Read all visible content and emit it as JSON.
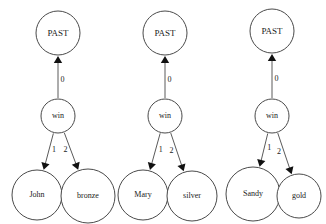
{
  "diagram": {
    "type": "dependency-tree",
    "background_color": "#ffffff",
    "node_stroke_color": "#4a4a4a",
    "edge_color": "#5a5a5a",
    "arrow_color": "#111111",
    "text_color": "#1a1a1a",
    "groups": [
      {
        "id": "group-1",
        "root": {
          "id": "past-1",
          "label": "PAST",
          "cx": 58,
          "cy": 33,
          "r": 22,
          "font_size": 9
        },
        "predicate": {
          "id": "win-1",
          "label": "win",
          "cx": 58,
          "cy": 116,
          "r": 17,
          "font_size": 8
        },
        "arguments": [
          {
            "id": "john",
            "label": "John",
            "cx": 37,
            "cy": 195,
            "r": 25,
            "font_size": 8,
            "edge_label": "1"
          },
          {
            "id": "bronze",
            "label": "bronze",
            "cx": 88,
            "cy": 196,
            "r": 27,
            "font_size": 8,
            "edge_label": "2"
          }
        ],
        "root_edge_label": "0"
      },
      {
        "id": "group-2",
        "root": {
          "id": "past-2",
          "label": "PAST",
          "cx": 165,
          "cy": 33,
          "r": 22,
          "font_size": 9
        },
        "predicate": {
          "id": "win-2",
          "label": "win",
          "cx": 165,
          "cy": 116,
          "r": 17,
          "font_size": 8
        },
        "arguments": [
          {
            "id": "mary",
            "label": "Mary",
            "cx": 143,
            "cy": 195,
            "r": 25,
            "font_size": 8,
            "edge_label": "1"
          },
          {
            "id": "silver",
            "label": "silver",
            "cx": 192,
            "cy": 196,
            "r": 25,
            "font_size": 8,
            "edge_label": "2"
          }
        ],
        "root_edge_label": "0"
      },
      {
        "id": "group-3",
        "root": {
          "id": "past-3",
          "label": "PAST",
          "cx": 272,
          "cy": 31,
          "r": 22,
          "font_size": 9
        },
        "predicate": {
          "id": "win-3",
          "label": "win",
          "cx": 272,
          "cy": 116,
          "r": 17,
          "font_size": 8
        },
        "arguments": [
          {
            "id": "sandy",
            "label": "Sandy",
            "cx": 253,
            "cy": 194,
            "r": 27,
            "font_size": 8,
            "edge_label": "1"
          },
          {
            "id": "gold",
            "label": "gold",
            "cx": 299,
            "cy": 196,
            "r": 22,
            "font_size": 8,
            "edge_label": "2"
          }
        ],
        "root_edge_label": "0"
      }
    ]
  }
}
